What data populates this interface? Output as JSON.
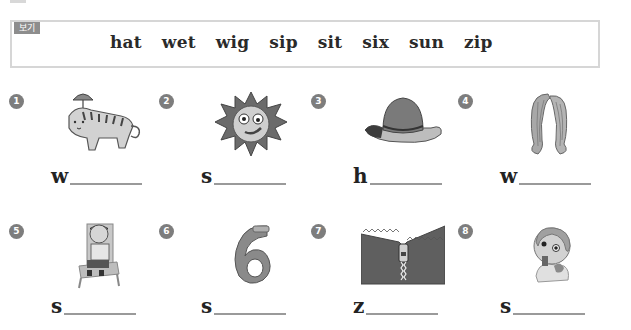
{
  "word_box": {
    "label": "보기",
    "words": [
      "hat",
      "wet",
      "wig",
      "sip",
      "sit",
      "six",
      "sun",
      "zip"
    ]
  },
  "items": [
    {
      "number": "1",
      "picture": "wet-cat-icon",
      "first_letter": "w"
    },
    {
      "number": "2",
      "picture": "sun-icon",
      "first_letter": "s"
    },
    {
      "number": "3",
      "picture": "hat-icon",
      "first_letter": "h"
    },
    {
      "number": "4",
      "picture": "wig-icon",
      "first_letter": "w"
    },
    {
      "number": "5",
      "picture": "boy-sitting-icon",
      "first_letter": "s"
    },
    {
      "number": "6",
      "picture": "number-six-icon",
      "first_letter": "s"
    },
    {
      "number": "7",
      "picture": "zipper-icon",
      "first_letter": "z"
    },
    {
      "number": "8",
      "picture": "boy-sipping-icon",
      "first_letter": "s"
    }
  ]
}
